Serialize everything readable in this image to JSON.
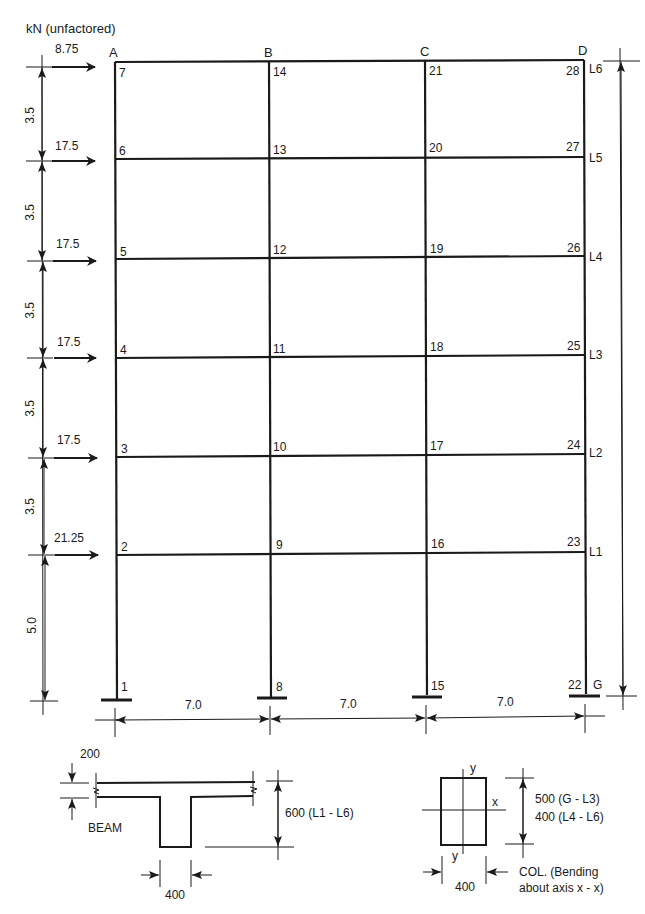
{
  "diagram": {
    "unit_label": "kN (unfactored)",
    "columns": [
      {
        "name": "A",
        "x": 115
      },
      {
        "name": "B",
        "x": 269
      },
      {
        "name": "C",
        "x": 425
      },
      {
        "name": "D",
        "x": 584
      }
    ],
    "levels": [
      {
        "name": "G",
        "y": 697
      },
      {
        "name": "L1",
        "y": 553
      },
      {
        "name": "L2",
        "y": 456
      },
      {
        "name": "L3",
        "y": 357
      },
      {
        "name": "L4",
        "y": 259
      },
      {
        "name": "L5",
        "y": 159
      },
      {
        "name": "L6",
        "y": 62
      }
    ],
    "nodes": {
      "A": [
        "1",
        "2",
        "3",
        "4",
        "5",
        "6",
        "7"
      ],
      "B": [
        "8",
        "9",
        "10",
        "11",
        "12",
        "13",
        "14"
      ],
      "C": [
        "15",
        "16",
        "17",
        "18",
        "19",
        "20",
        "21"
      ],
      "D": [
        "22",
        "23",
        "24",
        "25",
        "26",
        "27",
        "28"
      ]
    },
    "loads": [
      {
        "level": "L6",
        "value": "8.75"
      },
      {
        "level": "L5",
        "value": "17.5"
      },
      {
        "level": "L4",
        "value": "17.5"
      },
      {
        "level": "L3",
        "value": "17.5"
      },
      {
        "level": "L2",
        "value": "17.5"
      },
      {
        "level": "L1",
        "value": "21.25"
      }
    ],
    "storey_heights": [
      "5.0",
      "3.5",
      "3.5",
      "3.5",
      "3.5",
      "3.5"
    ],
    "bay_widths": [
      "7.0",
      "7.0",
      "7.0"
    ]
  },
  "beam_section": {
    "label": "BEAM",
    "flange_thickness": "200",
    "depth": "600 (L1 - L6)",
    "web_width": "400"
  },
  "column_section": {
    "axis_x": "x",
    "axis_y": "y",
    "depth_line1": "500 (G - L3)",
    "depth_line2": "400 (L4 - L6)",
    "width": "400",
    "caption_line1": "COL. (Bending",
    "caption_line2": "about axis x - x)"
  },
  "colors": {
    "ink": "#1a1a1a",
    "background": "#ffffff"
  }
}
